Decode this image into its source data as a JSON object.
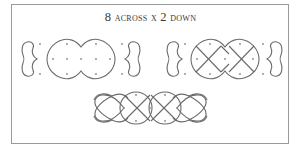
{
  "title": {
    "number_across": "8",
    "word_across": "across",
    "separator": "x",
    "number_down": "2",
    "word_down": "down",
    "full": "8 ACROSS X 2 DOWN"
  },
  "colors": {
    "frame_border": "#9a9a9a",
    "line": "#6b6b6b",
    "dot": "#8a8a8a",
    "background": "#ffffff",
    "text": "#3a3a3a"
  },
  "panels": [
    {
      "name": "step-1-outline-loops",
      "description": "Left heart, double oval with dot grid, right heart"
    },
    {
      "name": "step-2-diagonal-crossings",
      "description": "Left heart, double oval with X diagonals through dot grid, right heart"
    },
    {
      "name": "step-3-finished-knot",
      "description": "Completed interlaced pattern joining hearts and ovals"
    }
  ]
}
